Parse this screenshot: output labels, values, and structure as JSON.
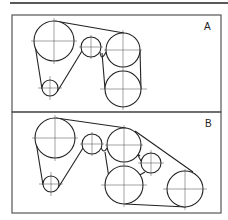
{
  "figure": {
    "type": "belt-routing-diagram",
    "panels": [
      {
        "label": "A",
        "pulleys": [
          {
            "name": "large-top-left",
            "cx": 54,
            "cy": 41,
            "r": 20
          },
          {
            "name": "small-bottom-left",
            "cx": 50,
            "cy": 88,
            "r": 8
          },
          {
            "name": "idler-middle",
            "cx": 91,
            "cy": 47,
            "r": 10
          },
          {
            "name": "upper-right",
            "cx": 123,
            "cy": 50,
            "r": 17
          },
          {
            "name": "lower-right",
            "cx": 123,
            "cy": 89,
            "r": 18
          }
        ]
      },
      {
        "label": "B",
        "pulleys": [
          {
            "name": "large-top-left",
            "cx": 55,
            "cy": 138,
            "r": 20
          },
          {
            "name": "small-bottom-left",
            "cx": 51,
            "cy": 184,
            "r": 8
          },
          {
            "name": "idler-middle",
            "cx": 92,
            "cy": 144,
            "r": 10
          },
          {
            "name": "upper-center",
            "cx": 124,
            "cy": 145,
            "r": 17
          },
          {
            "name": "lower-center",
            "cx": 124,
            "cy": 185,
            "r": 19
          },
          {
            "name": "idler-right",
            "cx": 151,
            "cy": 163,
            "r": 10
          },
          {
            "name": "far-right",
            "cx": 185,
            "cy": 189,
            "r": 18
          }
        ]
      }
    ]
  }
}
